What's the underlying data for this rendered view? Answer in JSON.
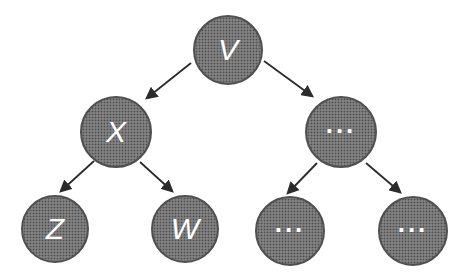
{
  "diagram": {
    "type": "tree",
    "nodes": [
      {
        "id": "root",
        "label": "V",
        "level": 0
      },
      {
        "id": "left-child",
        "label": "X",
        "level": 1
      },
      {
        "id": "right-child",
        "label": "...",
        "level": 1
      },
      {
        "id": "leaf-z",
        "label": "Z",
        "level": 2
      },
      {
        "id": "leaf-w",
        "label": "W",
        "level": 2
      },
      {
        "id": "leaf-dots-1",
        "label": "...",
        "level": 2
      },
      {
        "id": "leaf-dots-2",
        "label": "...",
        "level": 2
      }
    ],
    "edges": [
      {
        "from": "V",
        "to": "X"
      },
      {
        "from": "V",
        "to": "..."
      },
      {
        "from": "X",
        "to": "Z"
      },
      {
        "from": "X",
        "to": "W"
      },
      {
        "from": "...",
        "to": "..."
      },
      {
        "from": "...",
        "to": "..."
      }
    ],
    "colors": {
      "node_fill": "#828282",
      "node_halftone_dot": "#4e4e4e",
      "node_border": "#4f4f4f",
      "label_text": "#ffffff",
      "arrow": "#2b2b2b",
      "background": "#ffffff"
    }
  }
}
